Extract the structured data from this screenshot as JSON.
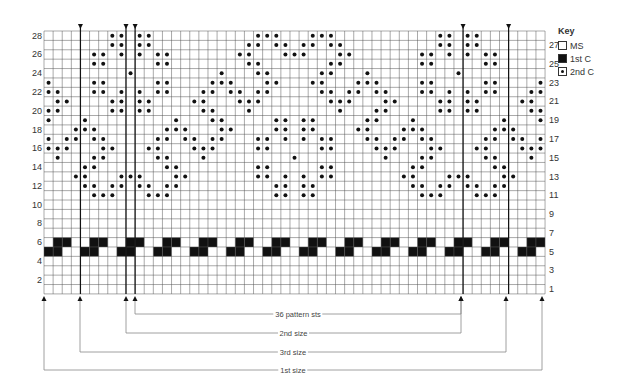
{
  "chart_data": {
    "type": "knitting-chart",
    "title": "",
    "grid": {
      "columns": 55,
      "rows": 28,
      "left": 44,
      "top": 31,
      "cell_w": 9.11,
      "cell_h": 9.39
    },
    "row_labels_left": [
      2,
      4,
      6,
      8,
      10,
      12,
      14,
      16,
      18,
      20,
      22,
      24,
      26,
      28
    ],
    "row_labels_right": [
      1,
      3,
      5,
      7,
      9,
      11,
      13,
      15,
      17,
      19,
      21,
      23,
      25,
      27
    ],
    "contrast1_band": {
      "rows": [
        5,
        6
      ],
      "period": 4,
      "row6_cols_mod": [
        1,
        2
      ],
      "row5_cols_mod": [
        0,
        1
      ]
    },
    "motif_a": {
      "centers": [
        9,
        45
      ],
      "offsets_by_row": {
        "28": [
          -2,
          -1,
          1,
          2
        ],
        "27": [
          -2,
          -1,
          1,
          2
        ],
        "26": [
          -4,
          -3,
          -1,
          1,
          3,
          4
        ],
        "25": [
          -4,
          -3,
          3,
          4
        ],
        "24": [
          0
        ],
        "23": [
          -9,
          -4,
          -3,
          3,
          4,
          9
        ],
        "22": [
          -9,
          -8,
          -4,
          -3,
          -1,
          1,
          3,
          4,
          8,
          9
        ],
        "21": [
          -8,
          -7,
          -2,
          -1,
          1,
          2,
          7,
          8
        ],
        "20": [
          -9,
          -8,
          -2,
          -1,
          1,
          2,
          8,
          9
        ],
        "19": [
          -9,
          -5,
          5,
          9
        ],
        "18": [
          -6,
          -5,
          -4,
          4,
          5,
          6
        ],
        "17": [
          -9,
          -7,
          -6,
          -4,
          -3,
          3,
          4,
          6,
          7,
          9
        ],
        "16": [
          -9,
          -8,
          -7,
          -3,
          -2,
          2,
          3,
          7,
          8,
          9
        ],
        "15": [
          -8,
          -4,
          -3,
          3,
          4,
          8
        ],
        "14": [
          -5,
          -4,
          4,
          5
        ],
        "13": [
          -6,
          -5,
          -1,
          0,
          1,
          5,
          6
        ],
        "12": [
          -5,
          -4,
          -2,
          -1,
          1,
          2,
          4,
          5
        ],
        "11": [
          -4,
          -3,
          -2,
          2,
          3,
          4
        ]
      }
    },
    "motif_b": {
      "centers": [
        27
      ],
      "offsets_by_row": {
        "28": [
          -4,
          -3,
          -2,
          2,
          3,
          4
        ],
        "27": [
          -5,
          -4,
          -2,
          -1,
          1,
          2,
          4,
          5
        ],
        "26": [
          -6,
          -5,
          -1,
          0,
          1,
          5,
          6
        ],
        "25": [
          -5,
          -4,
          4,
          5
        ],
        "24": [
          -8,
          -4,
          -3,
          3,
          4,
          8
        ],
        "23": [
          -8,
          -7,
          -3,
          -2,
          2,
          3,
          7,
          8
        ],
        "22": [
          -7,
          -6,
          -4,
          -3,
          3,
          4,
          6,
          7
        ],
        "21": [
          -6,
          -5,
          -4,
          4,
          5,
          6
        ],
        "20": [
          -5,
          5
        ],
        "19": [
          -8,
          -2,
          -1,
          1,
          2,
          8
        ],
        "18": [
          -8,
          -7,
          -2,
          -1,
          1,
          2,
          7,
          8
        ],
        "17": [
          -8,
          -4,
          -3,
          -1,
          1,
          3,
          4,
          8
        ],
        "16": [
          -4,
          -3,
          3,
          4
        ],
        "15": [
          0
        ],
        "14": [
          -4,
          -3,
          3,
          4
        ],
        "13": [
          -4,
          -3,
          -1,
          1,
          3,
          4
        ],
        "12": [
          -2,
          -1,
          1,
          2
        ],
        "11": [
          -2,
          -1,
          1,
          2
        ]
      }
    },
    "vertical_lines_at_col_boundary": [
      4,
      9,
      10,
      46,
      51
    ],
    "size_brackets": [
      {
        "label": "36 pattern sts",
        "from_x": 135,
        "to_x": 461,
        "y": 314
      },
      {
        "label": "2nd size",
        "from_x": 126,
        "to_x": 461,
        "y": 333
      },
      {
        "label": "3rd size",
        "from_x": 80,
        "to_x": 506,
        "y": 352
      },
      {
        "label": "1st size",
        "from_x": 44,
        "to_x": 542,
        "y": 370
      }
    ]
  },
  "key": {
    "title": "Key",
    "items": [
      {
        "label": "MS",
        "swatch": "blank"
      },
      {
        "label": "1st C",
        "swatch": "dark"
      },
      {
        "label": "2nd C",
        "swatch": "dot"
      }
    ]
  },
  "colors": {
    "grid": "#555555",
    "ink": "#111111",
    "bracket": "#888888"
  }
}
